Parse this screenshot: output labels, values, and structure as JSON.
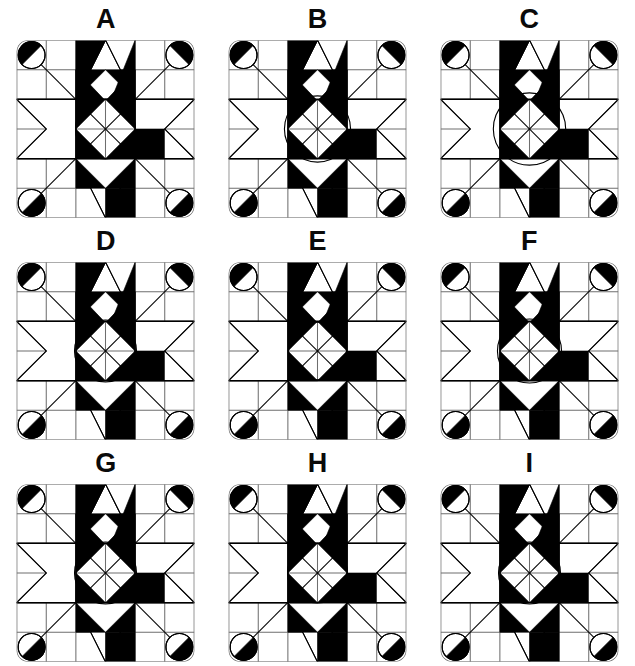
{
  "page": {
    "background_color": "#ffffff",
    "ink_color": "#000000",
    "grid_line_color": "#6e6e6e",
    "columns": 3,
    "rows": 3
  },
  "options": [
    {
      "label": "A",
      "name": "option-a",
      "center_circle_radius": 29,
      "corner_circle_radius": 13,
      "corner_half_fill": [
        "upper-right",
        "lower-right",
        "lower-left",
        "lower-left"
      ],
      "star_points": 8,
      "black_wedges": 8,
      "grid_divisions": 6
    },
    {
      "label": "B",
      "name": "option-b",
      "center_circle_radius": 32,
      "corner_circle_radius": 13,
      "corner_half_fill": [
        "upper-right",
        "lower-right",
        "lower-left",
        "lower-left"
      ],
      "star_points": 8,
      "black_wedges": 8,
      "grid_divisions": 6
    },
    {
      "label": "C",
      "name": "option-c",
      "center_circle_radius": 35,
      "corner_circle_radius": 13,
      "corner_half_fill": [
        "upper-right",
        "lower-right",
        "lower-left",
        "lower-left"
      ],
      "star_points": 8,
      "black_wedges": 8,
      "grid_divisions": 6
    },
    {
      "label": "D",
      "name": "option-d",
      "center_circle_radius": 30,
      "corner_circle_radius": 13,
      "corner_half_fill": [
        "upper-right",
        "lower-right",
        "lower-left",
        "lower-left"
      ],
      "star_points": 8,
      "black_wedges": 8,
      "grid_divisions": 6
    },
    {
      "label": "E",
      "name": "option-e",
      "center_circle_radius": 28,
      "corner_circle_radius": 13,
      "corner_half_fill": [
        "upper-right",
        "lower-right",
        "lower-left",
        "lower-left"
      ],
      "star_points": 8,
      "black_wedges": 8,
      "grid_divisions": 6
    },
    {
      "label": "F",
      "name": "option-f",
      "center_circle_radius": 31,
      "corner_circle_radius": 13,
      "corner_half_fill": [
        "upper-right",
        "lower-right",
        "lower-left",
        "lower-left"
      ],
      "star_points": 8,
      "black_wedges": 8,
      "grid_divisions": 6
    },
    {
      "label": "G",
      "name": "option-g",
      "center_circle_radius": 30,
      "corner_circle_radius": 13,
      "corner_half_fill": [
        "upper-right",
        "lower-right",
        "lower-left",
        "lower-left"
      ],
      "star_points": 8,
      "black_wedges": 8,
      "grid_divisions": 6
    },
    {
      "label": "H",
      "name": "option-h",
      "center_circle_radius": 29,
      "corner_circle_radius": 13,
      "corner_half_fill": [
        "upper-right",
        "lower-right",
        "lower-left",
        "lower-left"
      ],
      "star_points": 8,
      "black_wedges": 8,
      "grid_divisions": 6
    },
    {
      "label": "I",
      "name": "option-i",
      "center_circle_radius": 30,
      "corner_circle_radius": 13,
      "corner_half_fill": [
        "upper-right",
        "lower-right",
        "lower-left",
        "lower-left"
      ],
      "star_points": 8,
      "black_wedges": 8,
      "grid_divisions": 6
    }
  ]
}
